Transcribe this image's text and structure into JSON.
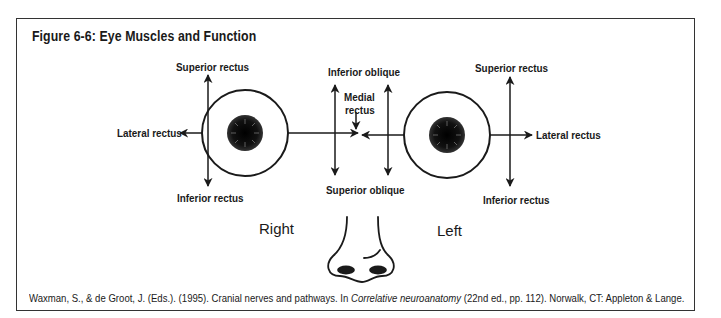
{
  "figure": {
    "title": "Figure 6-6: Eye Muscles and Function",
    "side_labels": {
      "right": "Right",
      "left": "Left"
    },
    "right_eye": {
      "superior_rectus": "Superior rectus",
      "inferior_rectus": "Inferior rectus",
      "lateral_rectus": "Lateral rectus"
    },
    "left_eye": {
      "superior_rectus": "Superior rectus",
      "inferior_rectus": "Inferior rectus",
      "lateral_rectus": "Lateral rectus"
    },
    "center": {
      "inferior_oblique": "Inferior oblique",
      "superior_oblique": "Superior oblique",
      "medial_rectus_line1": "Medial",
      "medial_rectus_line2": "rectus"
    },
    "citation": {
      "pre": "Waxman, S., & de Groot, J. (Eds.). (1995). Cranial nerves and pathways. In ",
      "italic": "Correlative neuroanatomy",
      "post": " (22nd ed., pp. 112). Norwalk, CT: Appleton & Lange."
    },
    "colors": {
      "line": "#1a1a1a",
      "frame": "#333333",
      "background": "#ffffff"
    }
  }
}
